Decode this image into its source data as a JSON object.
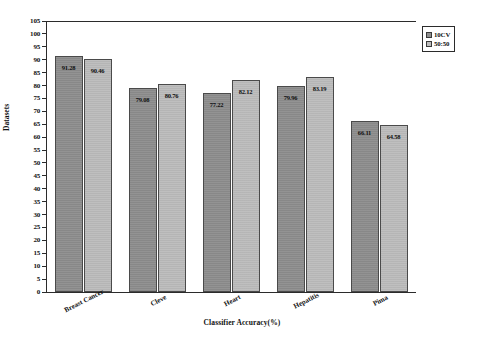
{
  "chart_data": {
    "type": "bar",
    "title": "",
    "xlabel": "Classifier Accuracy(%)",
    "ylabel": "Datasets",
    "categories": [
      "Breast Cancer",
      "Cleve",
      "Heart",
      "Hepatitis",
      "Pima"
    ],
    "series": [
      {
        "name": "10CV",
        "color": "#8e8e8e",
        "values": [
          91.28,
          79.08,
          77.22,
          79.96,
          66.11
        ]
      },
      {
        "name": "50:50",
        "color": "#bcbcbc",
        "values": [
          90.46,
          80.76,
          82.12,
          83.19,
          64.58
        ]
      }
    ],
    "value_labels": [
      [
        "91.28",
        "90.46"
      ],
      [
        "79.08",
        "80.76"
      ],
      [
        "77.22",
        "82.12"
      ],
      [
        "79.96",
        "83.19"
      ],
      [
        "66.11",
        "64.58"
      ]
    ],
    "ylim": [
      0,
      105
    ],
    "ytick_step": 5,
    "yticks": [
      105,
      100,
      95,
      90,
      85,
      80,
      75,
      70,
      65,
      60,
      55,
      50,
      45,
      40,
      35,
      30,
      25,
      20,
      15,
      10,
      5,
      0
    ],
    "ytick_labels": [
      "105",
      "100",
      "95",
      "90",
      "85",
      "80",
      "75",
      "70",
      "65",
      "60",
      "55",
      "50",
      "45",
      "40",
      "35",
      "30",
      "25",
      "20",
      "15",
      "10",
      "5",
      "0"
    ],
    "grid": false,
    "legend_position": "top-right-outside"
  },
  "legend": {
    "entries": [
      {
        "label": "10CV"
      },
      {
        "label": "50:50"
      }
    ]
  }
}
